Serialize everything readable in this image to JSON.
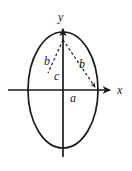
{
  "figure": {
    "kind": "ellipse-geometry-diagram",
    "background_color": "#ffffff",
    "stroke_color": "#1a1a1a",
    "canvas": {
      "width": 132,
      "height": 171
    },
    "origin": {
      "x": 63,
      "y": 90
    },
    "ellipse": {
      "center_x": 63,
      "center_y": 90,
      "semi_axis_x": 35,
      "semi_axis_y": 58,
      "stroke_width": 1.6,
      "fill": "none"
    },
    "axes": {
      "x_axis": {
        "label": "x",
        "start_x": 8,
        "end_x": 112,
        "y": 90,
        "has_arrow": true
      },
      "y_axis": {
        "label": "y",
        "x": 63,
        "start_y": 157,
        "end_y": 27,
        "has_arrow": true
      }
    },
    "dashed_segments": [
      {
        "name": "b-left-segment",
        "from_x": 63,
        "from_y": 40,
        "to_x": 47,
        "to_y": 74,
        "label": "b",
        "has_arrow": false
      },
      {
        "name": "b-right-segment",
        "from_x": 63,
        "from_y": 40,
        "to_x": 97,
        "to_y": 89,
        "label": "b",
        "has_arrow": true
      }
    ],
    "labels": {
      "axis_y": "y",
      "axis_x": "x",
      "b_left": "b",
      "b_right": "b",
      "c": "c",
      "a": "a"
    }
  }
}
